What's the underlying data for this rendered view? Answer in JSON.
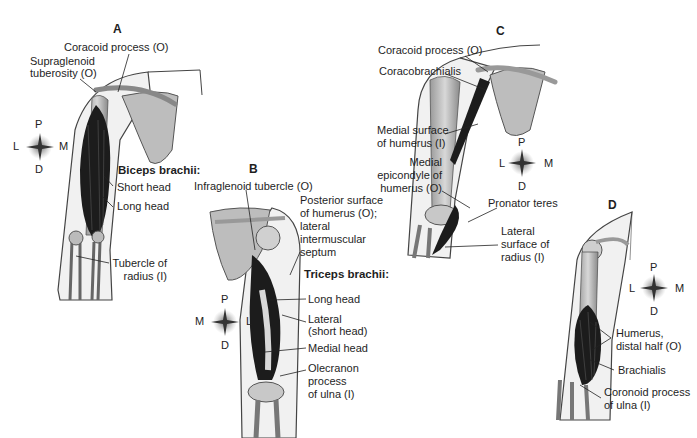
{
  "panels": [
    {
      "id": "A",
      "letter": "A",
      "muscle_title": "Biceps brachii:",
      "labels": {
        "coracoid": "Coracoid process (O)",
        "supraglenoid_1": "Supraglenoid",
        "supraglenoid_2": "tuberosity (O)",
        "short_head": "Short head",
        "long_head": "Long head",
        "tubercle_1": "Tubercle of",
        "tubercle_2": "radius (I)"
      },
      "compass": {
        "top": "P",
        "bottom": "D",
        "left": "L",
        "right": "M"
      }
    },
    {
      "id": "B",
      "letter": "B",
      "muscle_title": "Triceps brachii:",
      "labels": {
        "infraglenoid": "Infraglenoid tubercle (O)",
        "posterior_1": "Posterior surface",
        "posterior_2": "of humerus (O);",
        "posterior_3": "lateral",
        "posterior_4": "intermuscular",
        "posterior_5": "septum",
        "long_head": "Long head",
        "lateral_1": "Lateral",
        "lateral_2": "(short head)",
        "medial_head": "Medial head",
        "olecranon_1": "Olecranon",
        "olecranon_2": "process",
        "olecranon_3": "of ulna (I)"
      },
      "compass": {
        "top": "P",
        "bottom": "D",
        "left": "M",
        "right": "L"
      }
    },
    {
      "id": "C",
      "letter": "C",
      "labels": {
        "coracoid": "Coracoid process (O)",
        "coracobrachialis": "Coracobrachialis",
        "medial_surface_1": "Medial surface",
        "medial_surface_2": "of humerus (I)",
        "epicondyle_1": "Medial",
        "epicondyle_2": "epicondyle of",
        "epicondyle_3": "humerus (O)",
        "pronator": "Pronator teres",
        "lateral_radius_1": "Lateral",
        "lateral_radius_2": "surface of",
        "lateral_radius_3": "radius (I)"
      },
      "compass": {
        "top": "P",
        "bottom": "D",
        "left": "L",
        "right": "M"
      }
    },
    {
      "id": "D",
      "letter": "D",
      "labels": {
        "humerus_1": "Humerus,",
        "humerus_2": "distal half (O)",
        "brachialis": "Brachialis",
        "coronoid_1": "Coronoid process",
        "coronoid_2": "of ulna (I)"
      },
      "compass": {
        "top": "P",
        "bottom": "D",
        "left": "L",
        "right": "M"
      }
    }
  ],
  "colors": {
    "outline": "#3a3a3a",
    "muscle": "#1c1c1c",
    "bone": "#cfcfcf",
    "skin": "#efefef",
    "text": "#1e1e1e"
  }
}
